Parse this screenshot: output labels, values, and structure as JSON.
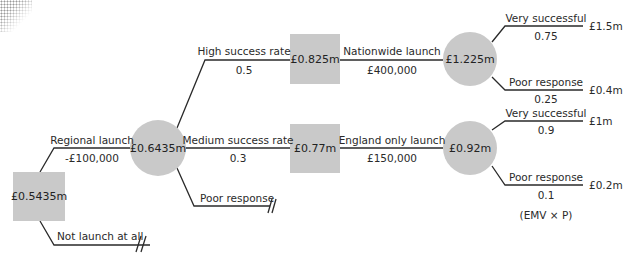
{
  "colors": {
    "node_fill": "#c9c9c9",
    "line": "#2a2a2a",
    "text": "#2a2a2a"
  },
  "nodes": {
    "root": {
      "type": "decision",
      "value": "£0.5435m"
    },
    "regional_chance": {
      "type": "chance",
      "value": "£0.6435m"
    },
    "high_decision": {
      "type": "decision",
      "value": "£0.825m"
    },
    "medium_decision": {
      "type": "decision",
      "value": "£0.77m"
    },
    "nationwide_chance": {
      "type": "chance",
      "value": "£1.225m"
    },
    "england_chance": {
      "type": "chance",
      "value": "£0.92m"
    }
  },
  "branches": {
    "regional_launch": {
      "label": "Regional launch",
      "cost": "-£100,000"
    },
    "not_launch": {
      "label": "Not launch at all"
    },
    "high_success": {
      "label": "High success rate",
      "probability": "0.5"
    },
    "medium_success": {
      "label": "Medium success rate",
      "probability": "0.3"
    },
    "poor_response_regional": {
      "label": "Poor response"
    },
    "nationwide_launch": {
      "label": "Nationwide launch",
      "cost": "£400,000"
    },
    "england_launch": {
      "label": "England only launch",
      "cost": "£150,000"
    },
    "nw_very_successful": {
      "label": "Very successful",
      "probability": "0.75",
      "payoff": "£1.5m"
    },
    "nw_poor_response": {
      "label": "Poor response",
      "probability": "0.25",
      "payoff": "£0.4m"
    },
    "eng_very_successful": {
      "label": "Very successful",
      "probability": "0.9",
      "payoff": "£1m"
    },
    "eng_poor_response": {
      "label": "Poor response",
      "probability": "0.1",
      "payoff": "£0.2m"
    }
  },
  "annotation": "(EMV × P)"
}
